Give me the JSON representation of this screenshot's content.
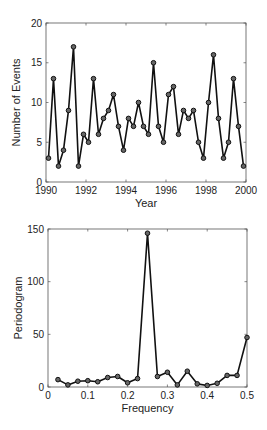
{
  "chart_data": [
    {
      "type": "line",
      "title": "",
      "xlabel": "Year",
      "ylabel": "Number of Events",
      "xlim": [
        1990,
        2000
      ],
      "ylim": [
        0,
        20
      ],
      "xticks": [
        "1990",
        "1992",
        "1994",
        "1996",
        "1998",
        "2000"
      ],
      "yticks": [
        "0",
        "5",
        "10",
        "15",
        "20"
      ],
      "grid": false,
      "marker": "circle",
      "x": [
        1990.125,
        1990.375,
        1990.625,
        1990.875,
        1991.125,
        1991.375,
        1991.625,
        1991.875,
        1992.125,
        1992.375,
        1992.625,
        1992.875,
        1993.125,
        1993.375,
        1993.625,
        1993.875,
        1994.125,
        1994.375,
        1994.625,
        1994.875,
        1995.125,
        1995.375,
        1995.625,
        1995.875,
        1996.125,
        1996.375,
        1996.625,
        1996.875,
        1997.125,
        1997.375,
        1997.625,
        1997.875,
        1998.125,
        1998.375,
        1998.625,
        1998.875,
        1999.125,
        1999.375,
        1999.625,
        1999.875
      ],
      "values": [
        3,
        13,
        2,
        4,
        9,
        17,
        2,
        6,
        5,
        13,
        6,
        8,
        9,
        11,
        7,
        4,
        8,
        7,
        10,
        7,
        6,
        15,
        7,
        5,
        11,
        12,
        6,
        9,
        8,
        9,
        5,
        3,
        10,
        16,
        8,
        3,
        5,
        13,
        7,
        2
      ]
    },
    {
      "type": "line",
      "title": "",
      "xlabel": "Frequency",
      "ylabel": "Periodogram",
      "xlim": [
        0,
        0.5
      ],
      "ylim": [
        0,
        150
      ],
      "xticks": [
        "0",
        "0.1",
        "0.2",
        "0.3",
        "0.4",
        "0.5"
      ],
      "yticks": [
        "0",
        "50",
        "100",
        "150"
      ],
      "grid": false,
      "marker": "circle",
      "x": [
        0.025,
        0.05,
        0.075,
        0.1,
        0.125,
        0.15,
        0.175,
        0.2,
        0.225,
        0.25,
        0.275,
        0.3,
        0.325,
        0.35,
        0.375,
        0.4,
        0.425,
        0.45,
        0.475,
        0.5
      ],
      "values": [
        7,
        2,
        5.5,
        6,
        5,
        9,
        10,
        4,
        8,
        146,
        10,
        14,
        2,
        15,
        3,
        1.5,
        3.5,
        11,
        11,
        47
      ]
    }
  ]
}
